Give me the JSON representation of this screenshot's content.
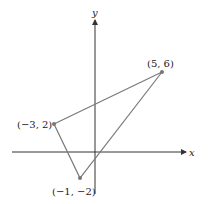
{
  "axes": {
    "x_label": "x",
    "y_label": "y",
    "color": "#333333"
  },
  "triangle": {
    "color": "#7a7a7a",
    "vertices": [
      {
        "label": "(5, 6)",
        "x": 5,
        "y": 6
      },
      {
        "label": "(−3, 2)",
        "x": -3,
        "y": 2
      },
      {
        "label": "(−1, −2)",
        "x": -1,
        "y": -2
      }
    ]
  }
}
